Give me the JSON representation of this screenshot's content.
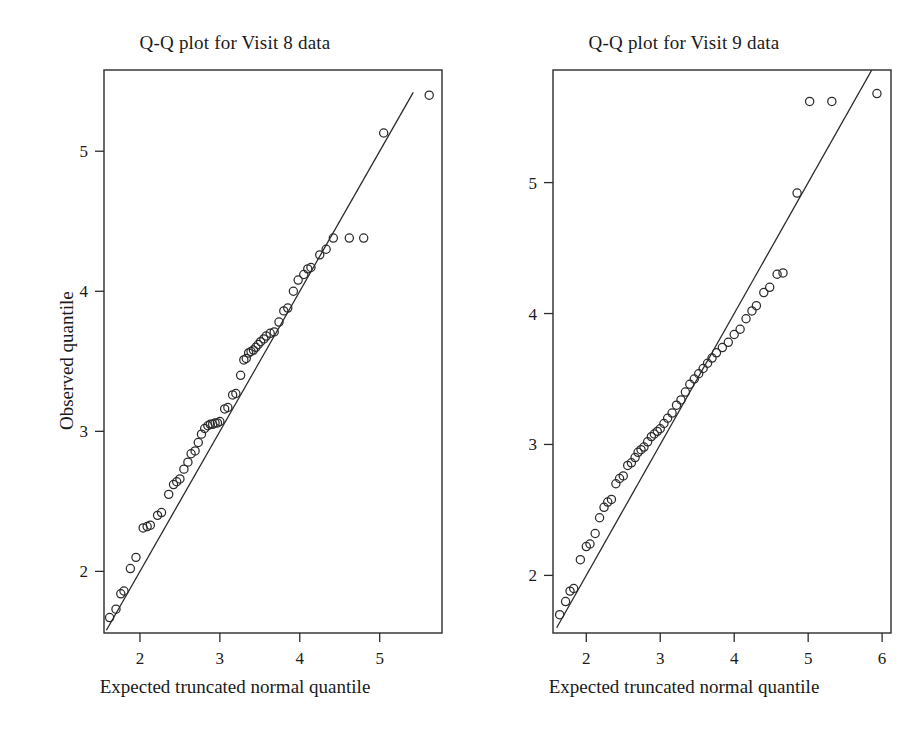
{
  "figure": {
    "background": "#ffffff",
    "ink": "#2b2b2b",
    "marker": "open-circle"
  },
  "chart_data": [
    {
      "type": "scatter",
      "title": "Q-Q plot for Visit 8 data",
      "xlabel": "Expected truncated normal quantile",
      "ylabel": "Observed quantile",
      "xlim": [
        1.55,
        5.78
      ],
      "ylim": [
        1.56,
        5.58
      ],
      "xticks": [
        2,
        3,
        4,
        5
      ],
      "yticks": [
        2,
        3,
        4,
        5
      ],
      "grid": false,
      "legend": "none",
      "reference_line": {
        "label": "y = x identity line",
        "x": [
          1.58,
          5.42
        ],
        "y": [
          1.58,
          5.42
        ]
      },
      "points": [
        {
          "x": 1.62,
          "y": 1.67
        },
        {
          "x": 1.7,
          "y": 1.73
        },
        {
          "x": 1.76,
          "y": 1.84
        },
        {
          "x": 1.8,
          "y": 1.86
        },
        {
          "x": 1.88,
          "y": 2.02
        },
        {
          "x": 1.95,
          "y": 2.1
        },
        {
          "x": 2.04,
          "y": 2.31
        },
        {
          "x": 2.09,
          "y": 2.32
        },
        {
          "x": 2.13,
          "y": 2.33
        },
        {
          "x": 2.22,
          "y": 2.4
        },
        {
          "x": 2.27,
          "y": 2.42
        },
        {
          "x": 2.36,
          "y": 2.55
        },
        {
          "x": 2.42,
          "y": 2.62
        },
        {
          "x": 2.46,
          "y": 2.64
        },
        {
          "x": 2.5,
          "y": 2.66
        },
        {
          "x": 2.55,
          "y": 2.73
        },
        {
          "x": 2.6,
          "y": 2.78
        },
        {
          "x": 2.64,
          "y": 2.84
        },
        {
          "x": 2.69,
          "y": 2.86
        },
        {
          "x": 2.73,
          "y": 2.92
        },
        {
          "x": 2.77,
          "y": 2.98
        },
        {
          "x": 2.81,
          "y": 3.02
        },
        {
          "x": 2.85,
          "y": 3.04
        },
        {
          "x": 2.88,
          "y": 3.05
        },
        {
          "x": 2.91,
          "y": 3.05
        },
        {
          "x": 2.94,
          "y": 3.06
        },
        {
          "x": 2.97,
          "y": 3.06
        },
        {
          "x": 3.0,
          "y": 3.07
        },
        {
          "x": 3.06,
          "y": 3.16
        },
        {
          "x": 3.1,
          "y": 3.17
        },
        {
          "x": 3.16,
          "y": 3.26
        },
        {
          "x": 3.2,
          "y": 3.27
        },
        {
          "x": 3.26,
          "y": 3.4
        },
        {
          "x": 3.3,
          "y": 3.51
        },
        {
          "x": 3.33,
          "y": 3.52
        },
        {
          "x": 3.36,
          "y": 3.56
        },
        {
          "x": 3.39,
          "y": 3.57
        },
        {
          "x": 3.42,
          "y": 3.58
        },
        {
          "x": 3.45,
          "y": 3.6
        },
        {
          "x": 3.48,
          "y": 3.62
        },
        {
          "x": 3.51,
          "y": 3.64
        },
        {
          "x": 3.55,
          "y": 3.66
        },
        {
          "x": 3.58,
          "y": 3.68
        },
        {
          "x": 3.63,
          "y": 3.7
        },
        {
          "x": 3.68,
          "y": 3.71
        },
        {
          "x": 3.74,
          "y": 3.78
        },
        {
          "x": 3.8,
          "y": 3.86
        },
        {
          "x": 3.85,
          "y": 3.88
        },
        {
          "x": 3.92,
          "y": 4.0
        },
        {
          "x": 3.98,
          "y": 4.08
        },
        {
          "x": 4.05,
          "y": 4.12
        },
        {
          "x": 4.1,
          "y": 4.16
        },
        {
          "x": 4.14,
          "y": 4.17
        },
        {
          "x": 4.25,
          "y": 4.26
        },
        {
          "x": 4.33,
          "y": 4.3
        },
        {
          "x": 4.42,
          "y": 4.38
        },
        {
          "x": 4.62,
          "y": 4.38
        },
        {
          "x": 4.8,
          "y": 4.38
        },
        {
          "x": 5.05,
          "y": 5.13
        },
        {
          "x": 5.62,
          "y": 5.4
        }
      ]
    },
    {
      "type": "scatter",
      "title": "Q-Q plot for Visit 9 data",
      "xlabel": "Expected truncated normal quantile",
      "ylabel": "Observed quantile",
      "xlim": [
        1.55,
        6.12
      ],
      "ylim": [
        1.56,
        5.86
      ],
      "xticks": [
        2,
        3,
        4,
        5,
        6
      ],
      "yticks": [
        2,
        3,
        4,
        5
      ],
      "grid": false,
      "legend": "none",
      "reference_line": {
        "label": "y = x identity line",
        "x": [
          1.6,
          5.95
        ],
        "y": [
          1.6,
          5.95
        ]
      },
      "points": [
        {
          "x": 1.64,
          "y": 1.7
        },
        {
          "x": 1.72,
          "y": 1.8
        },
        {
          "x": 1.78,
          "y": 1.88
        },
        {
          "x": 1.83,
          "y": 1.9
        },
        {
          "x": 1.92,
          "y": 2.12
        },
        {
          "x": 2.0,
          "y": 2.22
        },
        {
          "x": 2.05,
          "y": 2.24
        },
        {
          "x": 2.12,
          "y": 2.32
        },
        {
          "x": 2.18,
          "y": 2.44
        },
        {
          "x": 2.24,
          "y": 2.52
        },
        {
          "x": 2.29,
          "y": 2.56
        },
        {
          "x": 2.34,
          "y": 2.58
        },
        {
          "x": 2.4,
          "y": 2.7
        },
        {
          "x": 2.45,
          "y": 2.74
        },
        {
          "x": 2.5,
          "y": 2.76
        },
        {
          "x": 2.56,
          "y": 2.84
        },
        {
          "x": 2.61,
          "y": 2.86
        },
        {
          "x": 2.66,
          "y": 2.9
        },
        {
          "x": 2.7,
          "y": 2.94
        },
        {
          "x": 2.74,
          "y": 2.96
        },
        {
          "x": 2.78,
          "y": 2.98
        },
        {
          "x": 2.83,
          "y": 3.02
        },
        {
          "x": 2.88,
          "y": 3.06
        },
        {
          "x": 2.92,
          "y": 3.08
        },
        {
          "x": 2.96,
          "y": 3.1
        },
        {
          "x": 3.0,
          "y": 3.12
        },
        {
          "x": 3.05,
          "y": 3.16
        },
        {
          "x": 3.1,
          "y": 3.2
        },
        {
          "x": 3.16,
          "y": 3.24
        },
        {
          "x": 3.22,
          "y": 3.3
        },
        {
          "x": 3.28,
          "y": 3.34
        },
        {
          "x": 3.34,
          "y": 3.4
        },
        {
          "x": 3.4,
          "y": 3.46
        },
        {
          "x": 3.46,
          "y": 3.5
        },
        {
          "x": 3.52,
          "y": 3.54
        },
        {
          "x": 3.58,
          "y": 3.58
        },
        {
          "x": 3.64,
          "y": 3.62
        },
        {
          "x": 3.7,
          "y": 3.66
        },
        {
          "x": 3.76,
          "y": 3.7
        },
        {
          "x": 3.84,
          "y": 3.74
        },
        {
          "x": 3.92,
          "y": 3.78
        },
        {
          "x": 4.0,
          "y": 3.84
        },
        {
          "x": 4.08,
          "y": 3.88
        },
        {
          "x": 4.16,
          "y": 3.96
        },
        {
          "x": 4.24,
          "y": 4.02
        },
        {
          "x": 4.3,
          "y": 4.06
        },
        {
          "x": 4.4,
          "y": 4.16
        },
        {
          "x": 4.48,
          "y": 4.2
        },
        {
          "x": 4.58,
          "y": 4.3
        },
        {
          "x": 4.66,
          "y": 4.31
        },
        {
          "x": 4.85,
          "y": 4.92
        },
        {
          "x": 5.02,
          "y": 5.62
        },
        {
          "x": 5.32,
          "y": 5.62
        },
        {
          "x": 5.93,
          "y": 5.68
        }
      ]
    }
  ]
}
